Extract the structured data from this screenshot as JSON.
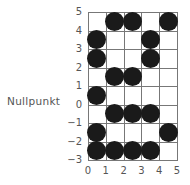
{
  "label": "Nullpunkt",
  "y_labels": [
    "5",
    "4",
    "3",
    "2",
    "1",
    "0",
    "−1",
    "−2",
    "−3"
  ],
  "x_labels": [
    "0",
    "1",
    "2",
    "3",
    "4",
    "5"
  ],
  "cells": [
    [
      0,
      1,
      1,
      0,
      1
    ],
    [
      1,
      0,
      0,
      1,
      0
    ],
    [
      1,
      0,
      0,
      1,
      0
    ],
    [
      0,
      1,
      1,
      0,
      0
    ],
    [
      1,
      0,
      0,
      0,
      0
    ],
    [
      0,
      1,
      1,
      1,
      0
    ],
    [
      1,
      0,
      0,
      0,
      1
    ],
    [
      1,
      1,
      1,
      1,
      0
    ]
  ],
  "colors": {
    "dot": "#1a1a1a",
    "grid": "#777777",
    "text": "#555555"
  }
}
